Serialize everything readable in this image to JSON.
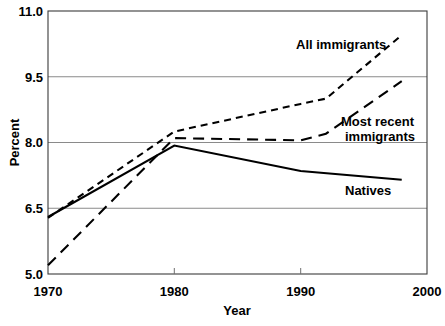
{
  "chart_data": {
    "type": "line",
    "title": "",
    "subtitle": "",
    "xlabel": "Year",
    "ylabel": "Percent",
    "xlim": [
      1970,
      2000
    ],
    "ylim": [
      5.0,
      11.0
    ],
    "xticks": [
      "1970",
      "1980",
      "1990",
      "2000"
    ],
    "xtick_values": [
      1970,
      1980,
      1990,
      2000
    ],
    "yticks": [
      "5.0",
      "6.5",
      "8.0",
      "9.5",
      "11.0"
    ],
    "ytick_values": [
      5.0,
      6.5,
      8.0,
      9.5,
      11.0
    ],
    "grid": "horizontal",
    "legend_position": "inline-annotations",
    "series": [
      {
        "name": "All immigrants",
        "style": "short-dashed",
        "color": "#000000",
        "x": [
          1970,
          1980,
          1990,
          1992,
          1998
        ],
        "values": [
          6.28,
          8.25,
          8.88,
          9.0,
          10.45
        ]
      },
      {
        "name": "Most recent immigrants",
        "style": "long-dashed",
        "color": "#000000",
        "x": [
          1970,
          1980,
          1990,
          1992,
          1998
        ],
        "values": [
          5.2,
          8.1,
          8.05,
          8.2,
          9.4
        ]
      },
      {
        "name": "Natives",
        "style": "solid",
        "color": "#000000",
        "x": [
          1970,
          1980,
          1990,
          1998
        ],
        "values": [
          6.3,
          7.93,
          7.35,
          7.15
        ]
      }
    ],
    "annotations": [
      {
        "text": "All immigrants",
        "series": "All immigrants"
      },
      {
        "text": "Most recent",
        "series": "Most recent immigrants"
      },
      {
        "text": "immigrants",
        "series": "Most recent immigrants"
      },
      {
        "text": "Natives",
        "series": "Natives"
      }
    ]
  },
  "axes": {
    "y_label": "Percent",
    "x_label": "Year",
    "y_tick_0": "11.0",
    "y_tick_1": "9.5",
    "y_tick_2": "8.0",
    "y_tick_3": "6.5",
    "y_tick_4": "5.0",
    "x_tick_0": "1970",
    "x_tick_1": "1980",
    "x_tick_2": "1990",
    "x_tick_3": "2000"
  },
  "labels": {
    "all_immigrants": "All immigrants",
    "most_recent_line1": "Most recent",
    "most_recent_line2": "immigrants",
    "natives": "Natives"
  },
  "colors": {
    "line": "#000000",
    "grid": "#8a8a8a",
    "frame": "#3b3b3b",
    "background": "#ffffff"
  }
}
